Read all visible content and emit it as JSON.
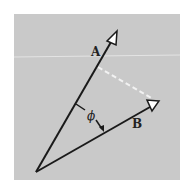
{
  "diagram": {
    "vectors": [
      {
        "name": "A",
        "label": "A",
        "tail": [
          36,
          172
        ],
        "tip": [
          115,
          35
        ]
      },
      {
        "name": "B",
        "label": "B",
        "tail": [
          36,
          172
        ],
        "tip": [
          157,
          103
        ]
      }
    ],
    "angle_label": "ϕ",
    "projection_line": {
      "style": "dashed",
      "color": "#ffffff"
    },
    "colors": {
      "background": "#c9c9c9",
      "stroke": "#1a1a1a",
      "arrowhead_fill": "#ffffff"
    }
  }
}
